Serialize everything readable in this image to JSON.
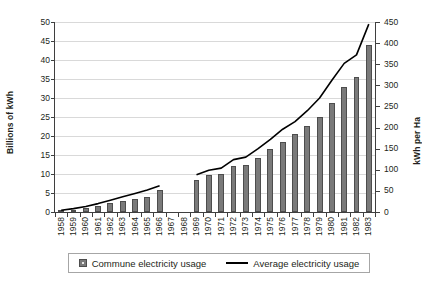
{
  "chart_data": {
    "type": "bar",
    "title": "",
    "xlabel": "",
    "ylabel": "Billions of kWh",
    "y2label": "kWh per Ha",
    "ylim": [
      0,
      50
    ],
    "y2lim": [
      0,
      450
    ],
    "grid": true,
    "legend_position": "bottom",
    "categories": [
      "1958",
      "1959",
      "1960",
      "1961",
      "1962",
      "1963",
      "1964",
      "1965",
      "1966",
      "1967",
      "1968",
      "1969",
      "1970",
      "1971",
      "1972",
      "1973",
      "1974",
      "1975",
      "1976",
      "1977",
      "1978",
      "1979",
      "1980",
      "1981",
      "1982",
      "1983"
    ],
    "yticks": [
      "0",
      "5",
      "10",
      "15",
      "20",
      "25",
      "30",
      "35",
      "40",
      "45",
      "50"
    ],
    "y2ticks": [
      "0",
      "50",
      "100",
      "150",
      "200",
      "250",
      "300",
      "350",
      "400",
      "450"
    ],
    "series": [
      {
        "name": "Commune electricity usage",
        "type": "bar",
        "axis": "left",
        "unit": "Billions of kWh",
        "color": "#7a7a7a",
        "values": [
          0.3,
          0.6,
          1.0,
          1.5,
          2.3,
          2.8,
          3.4,
          4.0,
          5.7,
          null,
          null,
          8.5,
          9.7,
          9.9,
          12.0,
          12.4,
          14.3,
          16.5,
          18.5,
          20.5,
          22.6,
          25.0,
          28.8,
          33.0,
          35.5,
          44.0
        ]
      },
      {
        "name": "Average electricity usage",
        "type": "line",
        "axis": "right",
        "unit": "kWh per Ha",
        "color": "#000000",
        "values": [
          4,
          8,
          13,
          20,
          28,
          36,
          44,
          52,
          62,
          null,
          null,
          88,
          99,
          104,
          124,
          130,
          150,
          172,
          196,
          214,
          240,
          270,
          312,
          352,
          372,
          445
        ]
      }
    ]
  },
  "legend": {
    "items": [
      {
        "label": "Commune electricity usage",
        "marker": "bar-swatch"
      },
      {
        "label": "Average electricity usage",
        "marker": "line-swatch"
      }
    ]
  }
}
